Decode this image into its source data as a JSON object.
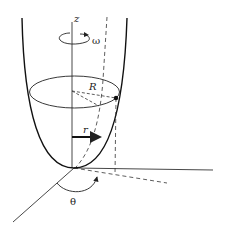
{
  "diagram": {
    "labels": {
      "z_axis": "z",
      "omega": "ω",
      "radius_R": "R",
      "radius_r": "r",
      "angle_theta": "θ"
    },
    "colors": {
      "stroke": "#222222",
      "background": "#ffffff"
    }
  }
}
